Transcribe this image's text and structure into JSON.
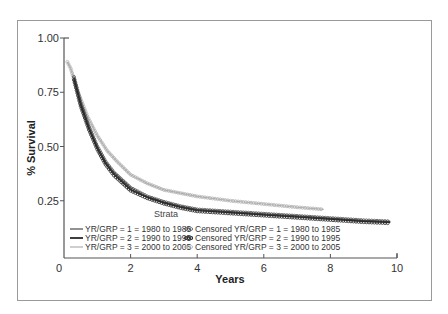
{
  "chart_data": {
    "type": "line",
    "title": "",
    "xlabel": "Years",
    "ylabel": "% Survival",
    "xlim": [
      0,
      10
    ],
    "ylim": [
      0,
      1.0
    ],
    "x_ticks": [
      "0",
      "2",
      "4",
      "6",
      "8",
      "10"
    ],
    "y_ticks": [
      "0.25",
      "0.50",
      "0.75",
      "1.00"
    ],
    "grid": false,
    "legend_title": "Strata",
    "legend_position": "lower-left inside",
    "series": [
      {
        "name": "YR/GRP = 1 = 1980  to 1985",
        "censored_name": "Censored YR/GRP = 1 = 1980  to 1985",
        "color": "#4a4a4a",
        "x": [
          0.3,
          0.5,
          0.75,
          1.0,
          1.25,
          1.5,
          2.0,
          2.5,
          3.0,
          3.5,
          4.0,
          5.0,
          6.0,
          7.0,
          8.0,
          9.0,
          9.8
        ],
        "values": [
          0.82,
          0.7,
          0.59,
          0.5,
          0.43,
          0.38,
          0.31,
          0.27,
          0.245,
          0.225,
          0.21,
          0.2,
          0.19,
          0.18,
          0.17,
          0.16,
          0.155
        ]
      },
      {
        "name": "YR/GRP = 2 = 1990  to 1995",
        "censored_name": "Censored YR/GRP = 2 = 1990  to 1995",
        "color": "#2a2a2a",
        "x": [
          0.3,
          0.5,
          0.75,
          1.0,
          1.25,
          1.5,
          2.0,
          2.5,
          3.0,
          3.5,
          4.0,
          5.0,
          6.0,
          7.0,
          8.0,
          9.0,
          9.8
        ],
        "values": [
          0.81,
          0.69,
          0.58,
          0.49,
          0.42,
          0.37,
          0.3,
          0.265,
          0.24,
          0.22,
          0.205,
          0.195,
          0.185,
          0.175,
          0.165,
          0.155,
          0.15
        ]
      },
      {
        "name": "YR/GRP = 3 = 2000  to 2005",
        "censored_name": "Censored YR/GRP = 3 = 2000  to 2005",
        "color": "#b0b0b0",
        "x": [
          0.1,
          0.2,
          0.4,
          0.7,
          1.0,
          1.3,
          1.6,
          2.0,
          2.5,
          3.0,
          3.5,
          4.0,
          5.0,
          6.0,
          7.0,
          7.8
        ],
        "values": [
          0.89,
          0.86,
          0.76,
          0.64,
          0.55,
          0.48,
          0.43,
          0.37,
          0.33,
          0.3,
          0.285,
          0.27,
          0.25,
          0.235,
          0.22,
          0.21
        ]
      }
    ]
  },
  "legend": {
    "title": "Strata",
    "lines": [
      "YR/GRP = 1 = 1980  to 1985",
      "YR/GRP = 2 = 1990  to 1995",
      "YR/GRP = 3 = 2000  to 2005"
    ],
    "censored": [
      "Censored YR/GRP = 1 = 1980  to 1985",
      "Censored YR/GRP = 2 = 1990  to 1995",
      "Censored YR/GRP = 3 = 2000  to 2005"
    ]
  }
}
